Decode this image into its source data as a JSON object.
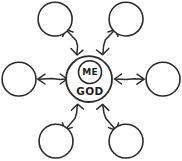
{
  "diagram": {
    "type": "hub-and-spoke",
    "style": "hand-drawn",
    "background_color": "#ffffff",
    "stroke_color": "#2b2b2b",
    "canvas": {
      "width": 182,
      "height": 161
    },
    "hub": {
      "name": "center-node",
      "cx": 89,
      "cy": 79,
      "r": 23,
      "inner": {
        "name": "me-circle",
        "cx": 90,
        "cy": 72,
        "r": 11.5,
        "label": "ME"
      },
      "label_below": "GOD",
      "label_below_x": 90,
      "label_below_y": 91
    },
    "nodes": [
      {
        "id": "node-top-left",
        "label": "",
        "cx": 55,
        "cy": 19,
        "r": 17
      },
      {
        "id": "node-top-right",
        "label": "",
        "cx": 126,
        "cy": 19,
        "r": 17
      },
      {
        "id": "node-left",
        "label": "",
        "cx": 19,
        "cy": 79,
        "r": 17
      },
      {
        "id": "node-right",
        "label": "",
        "cx": 163,
        "cy": 79,
        "r": 17
      },
      {
        "id": "node-bottom-left",
        "label": "",
        "cx": 56,
        "cy": 141,
        "r": 17
      },
      {
        "id": "node-bottom-right",
        "label": "",
        "cx": 126,
        "cy": 141,
        "r": 17
      }
    ],
    "connections": [
      {
        "id": "link-top-left",
        "from": "node-top-left",
        "to": "center-node",
        "arrows": "both"
      },
      {
        "id": "link-top-right",
        "from": "node-top-right",
        "to": "center-node",
        "arrows": "both"
      },
      {
        "id": "link-left",
        "from": "node-left",
        "to": "center-node",
        "arrows": "both"
      },
      {
        "id": "link-right",
        "from": "node-right",
        "to": "center-node",
        "arrows": "both"
      },
      {
        "id": "link-bottom-left",
        "from": "node-bottom-left",
        "to": "center-node",
        "arrows": "both"
      },
      {
        "id": "link-bottom-right",
        "from": "node-bottom-right",
        "to": "center-node",
        "arrows": "both"
      }
    ]
  }
}
